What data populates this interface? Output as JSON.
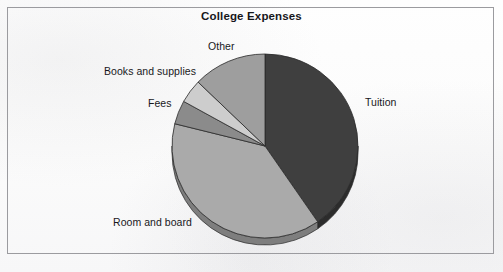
{
  "chart_data": {
    "type": "pie",
    "title": "College Expenses",
    "subtitle": "",
    "xlabel": "",
    "ylabel": "",
    "legend_position": "none",
    "grid": false,
    "labels_placement": "outside-callout",
    "categories": [
      "Tuition",
      "Room and board",
      "Fees",
      "Books and supplies",
      "Other"
    ],
    "values": [
      40.4,
      38.5,
      4.2,
      4.2,
      12.7
    ],
    "units": "percent",
    "start_angle_deg": 0,
    "direction": "clockwise",
    "slices": [
      {
        "label": "Tuition",
        "value": 40.4,
        "start_angle_deg": 0.0,
        "end_angle_deg": 145.5,
        "color": "#3f3f3f",
        "side_color": "#2c2c2c"
      },
      {
        "label": "Room and board",
        "value": 38.5,
        "start_angle_deg": 145.5,
        "end_angle_deg": 284.0,
        "color": "#aaaaaa",
        "side_color": "#7e7e7e"
      },
      {
        "label": "Fees",
        "value": 4.2,
        "start_angle_deg": 284.0,
        "end_angle_deg": 299.0,
        "color": "#8b8b8b",
        "side_color": "#6a6a6a"
      },
      {
        "label": "Books and supplies",
        "value": 4.2,
        "start_angle_deg": 299.0,
        "end_angle_deg": 314.0,
        "color": "#cdcdcd",
        "side_color": "#9c9c9c"
      },
      {
        "label": "Other",
        "value": 12.7,
        "start_angle_deg": 314.0,
        "end_angle_deg": 360.0,
        "color": "#9e9e9e",
        "side_color": "#787878"
      }
    ],
    "style": {
      "three_d": true,
      "outline_color": "#2a2a2a",
      "frame_color": "#9b9b9f",
      "background_color": "#fdfdfd",
      "title_color": "#16161a",
      "label_color": "#18181c"
    },
    "geometry": {
      "center_x": 265,
      "center_y": 146,
      "radius_x": 93,
      "radius_y": 92,
      "depth_px": 7
    }
  },
  "labels": {
    "tuition": "Tuition",
    "room_and_board": "Room and board",
    "fees": "Fees",
    "books_and_supplies": "Books and supplies",
    "other": "Other"
  }
}
